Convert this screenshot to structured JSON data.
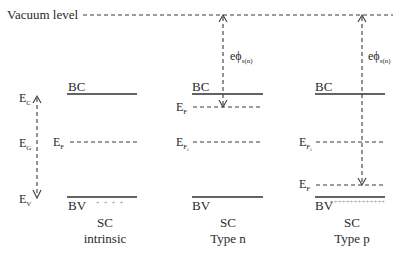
{
  "diagram": {
    "vacuum_level_label": "Vacuum level",
    "intrinsic": {
      "bc_label": "BC",
      "bv_label": "BV",
      "fermi_label": "E",
      "fermi_sub": "F",
      "ec_label": "E",
      "ec_sub": "C",
      "eg_label": "E",
      "eg_sub": "G",
      "ev_label": "E",
      "ev_sub": "V",
      "holes": "+   +   +   +",
      "caption_line1": "SC",
      "caption_line2": "intrinsic"
    },
    "type_n": {
      "bc_label": "BC",
      "bv_label": "BV",
      "fermi_label": "E",
      "fermi_sub": "F",
      "fermi_i_label": "E",
      "fermi_i_sub": "F",
      "fermi_i_subsub": "i",
      "work_function_label": "eϕ",
      "work_function_sub": "s(n)",
      "caption_line1": "SC",
      "caption_line2": "Type n"
    },
    "type_p": {
      "bc_label": "BC",
      "bv_label": "BV",
      "fermi_label": "E",
      "fermi_sub": "F",
      "fermi_i_label": "E",
      "fermi_i_sub": "F",
      "fermi_i_subsub": "i",
      "work_function_label": "eϕ",
      "work_function_sub": "s(n)",
      "holes": "++++++++++++++",
      "caption_line1": "SC",
      "caption_line2": "Type p"
    },
    "colors": {
      "line": "#2f2f2f",
      "text": "#2a2a2a",
      "background": "#ffffff"
    }
  }
}
